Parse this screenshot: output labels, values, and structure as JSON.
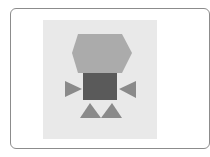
{
  "card": {
    "border_color": "#8c8c8c",
    "background": "#ffffff"
  },
  "thumbnail": {
    "background": "#e9e9e9",
    "shapes": [
      {
        "name": "hexagon",
        "color": "#ababab"
      },
      {
        "name": "square",
        "color": "#5a5a5a"
      },
      {
        "name": "left-triangle",
        "color": "#8a8a8a"
      },
      {
        "name": "right-triangle",
        "color": "#8a8a8a"
      },
      {
        "name": "bottom-left-triangle",
        "color": "#8a8a8a"
      },
      {
        "name": "bottom-right-triangle",
        "color": "#8a8a8a"
      }
    ]
  }
}
